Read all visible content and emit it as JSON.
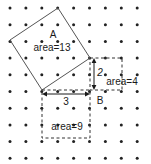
{
  "figure": {
    "width": 151,
    "height": 164,
    "background_color": "#ffffff"
  },
  "grid": {
    "name": "dot-lattice",
    "columns": 9,
    "rows": 10,
    "origin_x": 10,
    "origin_y": 8,
    "spacing_x": 15.9,
    "spacing_y": 16.7,
    "dot_radius": 1.5,
    "dot_color": "#222222"
  },
  "labels": {
    "square_a": "A",
    "square_a_area": "area=13",
    "square_small_side": "2",
    "square_small_area": "area=4",
    "square_large_side": "3",
    "square_large_area": "area=9",
    "triangle_b": "B"
  },
  "shapes": {
    "tilted_square_a": {
      "name": "tilted-square-a",
      "points": "58,8 90,58 42,90 10,40",
      "stroke": "#555555",
      "fill": "none",
      "stroke_width": 1,
      "style": "solid",
      "area": 13,
      "side_length_squared": 13
    },
    "small_square": {
      "name": "small-dashed-square",
      "x": 90,
      "y": 58,
      "width": 32,
      "height": 32,
      "stroke": "#333333",
      "fill": "none",
      "stroke_width": 1,
      "style": "dashed",
      "side": 2,
      "area": 4
    },
    "large_square": {
      "name": "large-dashed-square",
      "x": 42,
      "y": 90,
      "width": 48,
      "height": 48,
      "stroke": "#333333",
      "fill": "none",
      "stroke_width": 1,
      "style": "dashed",
      "side": 3,
      "area": 9
    },
    "triangle_b": {
      "name": "right-triangle-b",
      "points": "42,90 90,90 90,58",
      "legs": [
        3,
        2
      ],
      "hypotenuse_squared": 13
    }
  },
  "arrows": {
    "vertical_measure_2": {
      "name": "vertical-measure-arrow",
      "x": 94,
      "y1": 59,
      "y2": 89,
      "color": "#1a1a1a",
      "value": "2"
    },
    "horizontal_measure_3": {
      "name": "horizontal-measure-arrow",
      "y": 94,
      "x1": 43,
      "x2": 89,
      "color": "#1a1a1a",
      "value": "3"
    }
  },
  "colors": {
    "dot": "#222222",
    "solid_stroke": "#555555",
    "dashed_stroke": "#333333",
    "text": "#1a1a1a",
    "background": "#ffffff"
  },
  "chart_data": {
    "type": "diagram",
    "squares": [
      {
        "label": "A",
        "area": 13,
        "orientation": "tilted",
        "line_style": "solid"
      },
      {
        "label": "",
        "side": 2,
        "area": 4,
        "orientation": "axis-aligned",
        "line_style": "dashed"
      },
      {
        "label": "",
        "side": 3,
        "area": 9,
        "orientation": "axis-aligned",
        "line_style": "dashed"
      }
    ],
    "triangle": {
      "label": "B",
      "legs": [
        3,
        2
      ],
      "hypotenuse_squared": 13
    },
    "relation": "3^2 + 2^2 = 13"
  }
}
